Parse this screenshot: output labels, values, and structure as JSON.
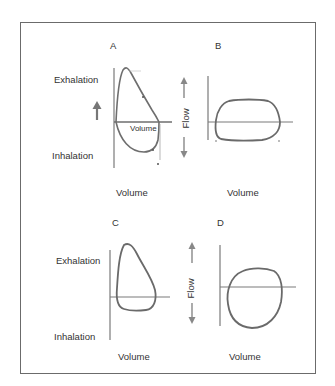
{
  "figure": {
    "border_color": "#6b6b6b",
    "curve_color": "#6e6e6e",
    "axis_color": "#7a7a7a",
    "panels": [
      {
        "id": "A",
        "letter": "A",
        "y_top_label": "Exhalation",
        "y_bottom_label": "Inhalation",
        "x_label": "Volume",
        "inner_label": "Volume",
        "has_up_arrow": true
      },
      {
        "id": "B",
        "letter": "B",
        "y_label": "Flow",
        "x_label": "Volume"
      },
      {
        "id": "C",
        "letter": "C",
        "y_top_label": "Exhalation",
        "y_bottom_label": "Inhalation",
        "x_label": "Volume"
      },
      {
        "id": "D",
        "letter": "D",
        "y_label": "Flow",
        "x_label": "Volume"
      }
    ]
  }
}
